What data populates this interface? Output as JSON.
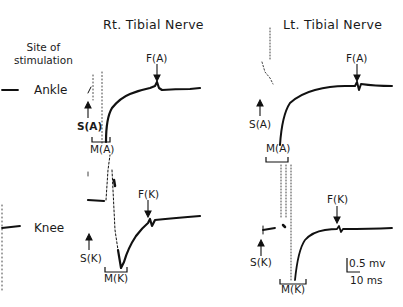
{
  "figure": {
    "column_titles": [
      "Rt. Tibial Nerve",
      "Lt. Tibial Nerve"
    ],
    "row_header": "Site of stimulation",
    "row_header_lines": [
      "Site of",
      "stimulation"
    ],
    "rows": [
      "Ankle",
      "Knee"
    ],
    "panels": {
      "right_ankle": {
        "stimulus": "S(A)",
        "m_wave": "M(A)",
        "f_wave": "F(A)"
      },
      "left_ankle": {
        "stimulus": "S(A)",
        "m_wave": "M(A)",
        "f_wave": "F(A)"
      },
      "right_knee": {
        "stimulus": "S(K)",
        "m_wave": "M(K)",
        "f_wave": "F(K)"
      },
      "left_knee": {
        "stimulus": "S(K)",
        "m_wave": "M(K)",
        "f_wave": "F(K)"
      }
    },
    "scale_bar": {
      "amplitude": "0.5 mv",
      "time": "10 ms"
    },
    "trace_color": "#111111"
  }
}
